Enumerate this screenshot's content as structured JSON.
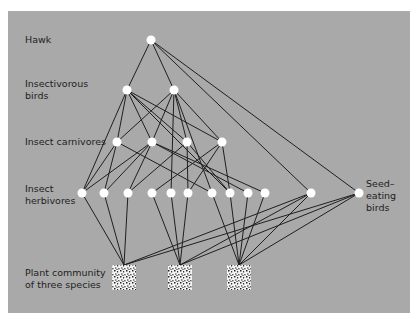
{
  "figure": {
    "background": "#a9a9a9",
    "edge_color": "#1f1f1f",
    "node_color": "#ffffff",
    "labels": {
      "hawk": "Hawk",
      "insectivorous_birds": "Insectivorous\nbirds",
      "insect_carnivores": "Insect carnivores",
      "insect_herbivores": "Insect\nherbivores",
      "seed_eating_birds": "Seed–\neating\nbirds",
      "plants": "Plant community\nof three species"
    },
    "nodes": {
      "hawk": [
        [
          151,
          40
        ]
      ],
      "birds": [
        [
          127,
          90
        ],
        [
          174,
          90
        ]
      ],
      "carnivores": [
        [
          117,
          142
        ],
        [
          152,
          142
        ],
        [
          187,
          142
        ],
        [
          222,
          142
        ]
      ],
      "herbivores": [
        [
          82,
          193
        ],
        [
          104,
          193
        ],
        [
          128,
          193
        ],
        [
          152,
          193
        ],
        [
          171,
          193
        ],
        [
          188,
          193
        ],
        [
          212,
          193
        ],
        [
          230,
          193
        ],
        [
          248,
          193
        ],
        [
          265,
          193
        ],
        [
          311,
          193
        ]
      ],
      "seed_birds": [
        [
          359,
          193
        ]
      ],
      "plants": [
        [
          124,
          277
        ],
        [
          180,
          277
        ],
        [
          239,
          277
        ]
      ]
    },
    "edges": [
      [
        "hawk",
        0,
        "birds",
        0
      ],
      [
        "hawk",
        0,
        "birds",
        1
      ],
      [
        "hawk",
        0,
        "herbivores",
        10
      ],
      [
        "hawk",
        0,
        "seed_birds",
        0
      ],
      [
        "birds",
        0,
        "herbivores",
        0
      ],
      [
        "birds",
        0,
        "carnivores",
        0
      ],
      [
        "birds",
        0,
        "carnivores",
        1
      ],
      [
        "birds",
        0,
        "carnivores",
        2
      ],
      [
        "birds",
        0,
        "carnivores",
        3
      ],
      [
        "birds",
        0,
        "herbivores",
        7
      ],
      [
        "birds",
        1,
        "carnivores",
        0
      ],
      [
        "birds",
        1,
        "carnivores",
        1
      ],
      [
        "birds",
        1,
        "herbivores",
        4
      ],
      [
        "birds",
        1,
        "carnivores",
        2
      ],
      [
        "birds",
        1,
        "herbivores",
        6
      ],
      [
        "birds",
        1,
        "carnivores",
        3
      ],
      [
        "carnivores",
        0,
        "herbivores",
        0
      ],
      [
        "carnivores",
        0,
        "herbivores",
        1
      ],
      [
        "carnivores",
        0,
        "herbivores",
        6
      ],
      [
        "carnivores",
        1,
        "herbivores",
        0
      ],
      [
        "carnivores",
        1,
        "herbivores",
        1
      ],
      [
        "carnivores",
        1,
        "herbivores",
        2
      ],
      [
        "carnivores",
        1,
        "herbivores",
        8
      ],
      [
        "carnivores",
        1,
        "herbivores",
        9
      ],
      [
        "carnivores",
        2,
        "herbivores",
        2
      ],
      [
        "carnivores",
        2,
        "herbivores",
        5
      ],
      [
        "carnivores",
        2,
        "herbivores",
        7
      ],
      [
        "carnivores",
        3,
        "herbivores",
        3
      ],
      [
        "carnivores",
        3,
        "herbivores",
        5
      ],
      [
        "carnivores",
        3,
        "herbivores",
        7
      ],
      [
        "herbivores",
        0,
        "plants",
        0
      ],
      [
        "herbivores",
        1,
        "plants",
        0
      ],
      [
        "herbivores",
        2,
        "plants",
        0
      ],
      [
        "herbivores",
        3,
        "plants",
        1
      ],
      [
        "herbivores",
        4,
        "plants",
        1
      ],
      [
        "herbivores",
        5,
        "plants",
        1
      ],
      [
        "herbivores",
        6,
        "plants",
        2
      ],
      [
        "herbivores",
        7,
        "plants",
        2
      ],
      [
        "herbivores",
        8,
        "plants",
        2
      ],
      [
        "herbivores",
        9,
        "plants",
        2
      ],
      [
        "herbivores",
        10,
        "plants",
        0
      ],
      [
        "herbivores",
        10,
        "plants",
        1
      ],
      [
        "herbivores",
        10,
        "plants",
        2
      ],
      [
        "seed_birds",
        0,
        "plants",
        0
      ],
      [
        "seed_birds",
        0,
        "plants",
        1
      ],
      [
        "seed_birds",
        0,
        "plants",
        2
      ]
    ]
  }
}
